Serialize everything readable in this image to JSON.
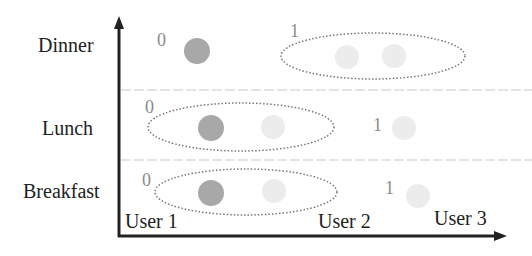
{
  "diagram": {
    "rows": [
      {
        "label": "Dinner"
      },
      {
        "label": "Lunch"
      },
      {
        "label": "Breakfast"
      }
    ],
    "users": [
      {
        "label": "User 1"
      },
      {
        "label": "User 2"
      },
      {
        "label": "User 3"
      }
    ],
    "annotations": {
      "dinner_user1": "0",
      "dinner_group": "1",
      "lunch_group": "0",
      "lunch_user3": "1",
      "breakfast_group": "0",
      "breakfast_user3": "1"
    },
    "colors": {
      "axis": "#222222",
      "active_dot": "#a8a8a8",
      "inactive_dot": "#ececec",
      "ellipse": "#777777",
      "separator": "#e4e4e4"
    }
  }
}
